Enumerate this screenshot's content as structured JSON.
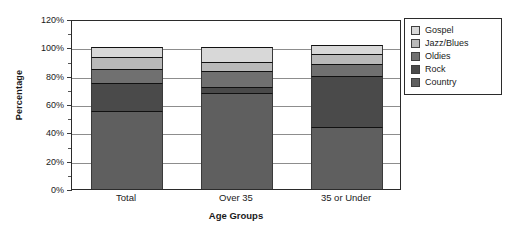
{
  "chart_data": {
    "type": "bar",
    "subtype": "stacked-bar-100",
    "title": "",
    "xlabel": "Age Groups",
    "ylabel": "Percentage",
    "categories": [
      "Total",
      "Over 35",
      "35 or Under"
    ],
    "ylim": [
      0,
      120
    ],
    "yticks": [
      "0%",
      "20%",
      "40%",
      "60%",
      "80%",
      "100%",
      "120%"
    ],
    "ytick_values": [
      0,
      20,
      40,
      60,
      80,
      100,
      120
    ],
    "minor_ticks": [
      10,
      30,
      50,
      70,
      90,
      110
    ],
    "grid": true,
    "grid_axis": "y",
    "legend_position": "right",
    "series": [
      {
        "name": "Country",
        "color": "#5f5f5f",
        "values": [
          55,
          68,
          44
        ]
      },
      {
        "name": "Rock",
        "color": "#4a4a4a",
        "values": [
          20,
          4,
          36
        ]
      },
      {
        "name": "Oldies",
        "color": "#707070",
        "values": [
          10,
          11,
          8
        ]
      },
      {
        "name": "Jazz/Blues",
        "color": "#b9b9b9",
        "values": [
          8,
          7,
          7
        ]
      },
      {
        "name": "Gospel",
        "color": "#d8d8d8",
        "values": [
          7,
          10,
          7
        ]
      }
    ],
    "legend_order": [
      "Gospel",
      "Jazz/Blues",
      "Oldies",
      "Rock",
      "Country"
    ],
    "totals": [
      100,
      100,
      100
    ],
    "axis_color": "#2b2b2b",
    "gridline_color": "#8d8d8d",
    "background": "#ffffff"
  }
}
